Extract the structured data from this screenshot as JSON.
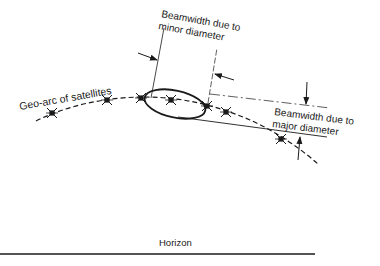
{
  "diagram": {
    "labels": {
      "geo_arc": "Geo-arc of satellites",
      "minor_line1": "Beamwidth due to",
      "minor_line2": "minor diameter",
      "major_line1": "Beamwidth due to",
      "major_line2": "major diameter",
      "horizon": "Horizon"
    },
    "satellite_count": 7,
    "colors": {
      "ink": "#1a1a1a",
      "background": "#ffffff"
    }
  }
}
